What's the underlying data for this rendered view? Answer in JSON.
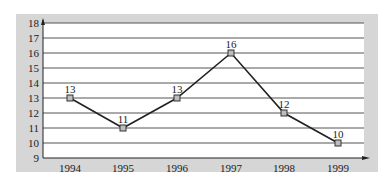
{
  "chart_data": {
    "type": "line",
    "title": "",
    "xlabel": "",
    "ylabel": "",
    "categories": [
      "1994",
      "1995",
      "1996",
      "1997",
      "1998",
      "1999"
    ],
    "series": [
      {
        "name": "",
        "values": [
          13,
          11,
          13,
          16,
          12,
          10
        ]
      }
    ],
    "data_labels": [
      "13",
      "11",
      "13",
      "16",
      "12",
      "10"
    ],
    "y_ticks": [
      "9",
      "10",
      "11",
      "12",
      "13",
      "14",
      "15",
      "16",
      "17",
      "18"
    ],
    "ylim": [
      9,
      18
    ],
    "grid": true,
    "legend": "none",
    "marker": "square",
    "colors": {
      "panel": "#d6d6d6",
      "plot": "#ffffff",
      "line": "#222222",
      "grid": "#555555",
      "marker_fill": "#bdbdbd"
    }
  }
}
